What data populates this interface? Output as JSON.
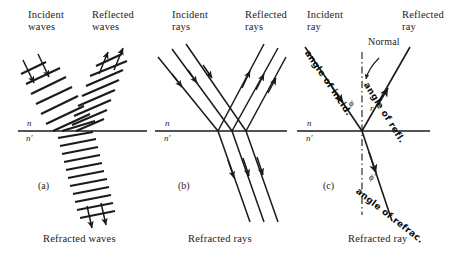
{
  "figure": {
    "title_caption": "Reflection and refraction of waves and rays at a plane interface",
    "background_color": "#ffffff",
    "ink_color": "#1a1a1a"
  },
  "panels": [
    {
      "id": "a",
      "label": "(a)",
      "top_left_label": "Incident\nwaves",
      "top_left_line1": "Incident",
      "top_left_line2": "waves",
      "top_right_line1": "Reflected",
      "top_right_line2": "waves",
      "bottom_caption": "Refracted waves",
      "medium_upper": "n",
      "medium_lower": "n′"
    },
    {
      "id": "b",
      "label": "(b)",
      "top_left_line1": "Incident",
      "top_left_line2": "rays",
      "top_right_line1": "Reflected",
      "top_right_line2": "rays",
      "bottom_caption": "Refracted rays",
      "medium_upper": "n",
      "medium_lower": "n′"
    },
    {
      "id": "c",
      "label": "(c)",
      "top_left_line1": "Incident",
      "top_left_line2": "ray",
      "top_right_line1": "Reflected",
      "top_right_line2": "ray",
      "bottom_caption": "Refracted ray",
      "normal_label": "Normal",
      "medium_upper": "n",
      "medium_lower": "n′",
      "angle_incidence_symbol": "ϕ",
      "angle_reflection_symbol": "r",
      "angle_refraction_symbol": "ϕ′",
      "handwritten": [
        {
          "name": "angle-of-incidence-note",
          "text": "angle of incid."
        },
        {
          "name": "angle-of-reflection-note",
          "text": "angle of refl."
        },
        {
          "name": "angle-of-refraction-note",
          "text": "angle of refrac."
        }
      ]
    }
  ],
  "handwritten_notes": {
    "incid": "angle of incid.",
    "refl": "angle of refl.",
    "refrac": "angle of refrac."
  },
  "colors": {
    "ink": "#1a1a1a",
    "hand_ink": "#0d0d0d",
    "paper": "#ffffff"
  }
}
